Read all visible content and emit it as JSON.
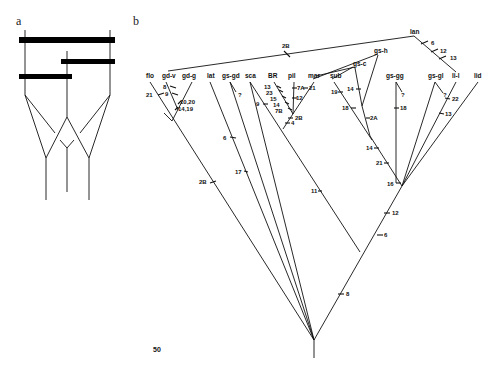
{
  "panel_a": {
    "label": "a",
    "description": "Schematic of three lineages joined by horizontal bars (hybridization/reticulation) above a branching tree"
  },
  "panel_b": {
    "label": "b",
    "scale_label": "50",
    "taxa": [
      {
        "id": "flo",
        "label": "flo"
      },
      {
        "id": "gd-v",
        "label": "gd-v"
      },
      {
        "id": "gd-g",
        "label": "gd-g"
      },
      {
        "id": "lat",
        "label": "lat"
      },
      {
        "id": "gs-gd",
        "label": "gs-gd"
      },
      {
        "id": "sca",
        "label": "sca"
      },
      {
        "id": "BR",
        "label": "BR"
      },
      {
        "id": "pil",
        "label": "pil"
      },
      {
        "id": "mar",
        "label": "mar"
      },
      {
        "id": "sub",
        "label": "sub"
      },
      {
        "id": "gs-c",
        "label": "gs-c"
      },
      {
        "id": "gs-h",
        "label": "gs-h"
      },
      {
        "id": "gs-gg",
        "label": "gs-gg"
      },
      {
        "id": "gs-gl",
        "label": "gs-gl"
      },
      {
        "id": "li-l",
        "label": "li-l"
      },
      {
        "id": "lan",
        "label": "lan"
      },
      {
        "id": "lid",
        "label": "lid"
      }
    ],
    "characters": {
      "flo": [
        "21"
      ],
      "gd_v": [
        "8",
        "9"
      ],
      "gd_node": [
        "10,20",
        "14,19"
      ],
      "gs_gd": [
        "?"
      ],
      "lat_stem": [
        "6",
        "17"
      ],
      "flo_stem": [
        "2B"
      ],
      "sca": [
        "9"
      ],
      "BR": [
        "13",
        "23",
        "15",
        "14",
        "7B"
      ],
      "pil": [
        "7A",
        "12"
      ],
      "mar": [
        "21"
      ],
      "pil_node": [
        "2B",
        "4"
      ],
      "lan_link": [
        "2B"
      ],
      "lan": [
        "6",
        "12",
        "13"
      ],
      "sub": [
        "19",
        "18"
      ],
      "gs_c": [
        "14"
      ],
      "gs_h_stem": [
        "2A"
      ],
      "gs_gg": [
        "?",
        "18"
      ],
      "gs_gl": [
        "?"
      ],
      "li_l": [
        "22",
        "13"
      ],
      "mar_stem": [
        "11"
      ],
      "upper_stem": [
        "14",
        "21",
        "16"
      ],
      "main_stem": [
        "12",
        "6",
        "8"
      ]
    }
  }
}
